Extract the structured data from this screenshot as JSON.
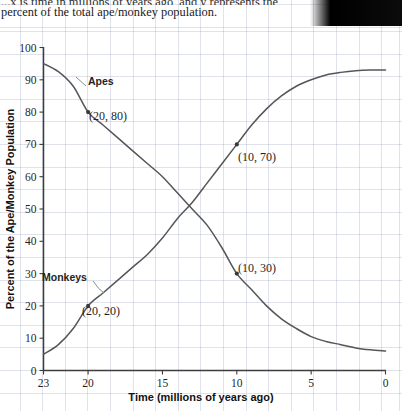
{
  "caption": {
    "line1_clipped": "...x is time in millions of years ago, and y represents the",
    "line2": "percent of the total ape/monkey population."
  },
  "chart_data": {
    "type": "line",
    "title": "",
    "xlabel": "Time (millions of years ago)",
    "ylabel": "Percent of the Ape/Monkey Population",
    "xlim": [
      23,
      0
    ],
    "ylim": [
      0,
      100
    ],
    "x_reversed": true,
    "grid": true,
    "grid_color": "#9aa4b9",
    "legend": "inline-labels",
    "xticks": [
      23,
      20,
      15,
      10,
      5,
      0
    ],
    "yticks": [
      0,
      10,
      20,
      30,
      40,
      50,
      60,
      70,
      80,
      90,
      100
    ],
    "curve_color": "#55555c",
    "series": [
      {
        "name": "Apes",
        "label": "Apes",
        "x": [
          23,
          22,
          21,
          20,
          19,
          18,
          17,
          16,
          15,
          14,
          13,
          12,
          11,
          10,
          9,
          8,
          7,
          6,
          5,
          4,
          3,
          2,
          1,
          0
        ],
        "values": [
          95,
          92.5,
          88,
          80,
          76,
          72,
          68,
          64,
          60,
          55,
          50,
          45,
          38,
          30,
          25,
          20,
          16,
          13,
          10.5,
          9,
          8,
          7,
          6.4,
          6
        ]
      },
      {
        "name": "Monkeys",
        "label": "Monkeys",
        "x": [
          23,
          22,
          21,
          20,
          19,
          18,
          17,
          16,
          15,
          14,
          13,
          12,
          11,
          10,
          9,
          8,
          7,
          6,
          5,
          4,
          3,
          2,
          1,
          0
        ],
        "values": [
          5,
          8,
          13,
          20,
          24,
          28,
          32,
          36,
          41,
          47,
          52,
          58,
          64,
          70,
          76,
          81,
          85,
          88,
          90,
          91.5,
          92.3,
          92.8,
          93,
          93
        ]
      }
    ],
    "annotations": [
      {
        "text": "(20, 80)",
        "x": 20,
        "y": 80,
        "series": "Apes"
      },
      {
        "text": "(10, 70)",
        "x": 10,
        "y": 70,
        "series": "Monkeys"
      },
      {
        "text": "(10, 30)",
        "x": 10,
        "y": 30,
        "series": "Apes"
      },
      {
        "text": "(20, 20)",
        "x": 20,
        "y": 20,
        "series": "Monkeys"
      }
    ]
  }
}
